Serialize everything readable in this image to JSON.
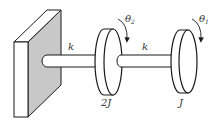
{
  "diagram": {
    "type": "torsional-system",
    "colors": {
      "stroke": "#1a1a1a",
      "wall_side": "#c8c8c8",
      "background": "#ffffff"
    },
    "wall": {
      "label": ""
    },
    "shafts": [
      {
        "id": "shaft-1",
        "label": "k"
      },
      {
        "id": "shaft-2",
        "label": "k"
      }
    ],
    "disks": [
      {
        "id": "disk-2",
        "inertia_label": "2J",
        "angle_label": "θ",
        "angle_sub": "2"
      },
      {
        "id": "disk-1",
        "inertia_label": "J",
        "angle_label": "θ",
        "angle_sub": "1"
      }
    ]
  }
}
